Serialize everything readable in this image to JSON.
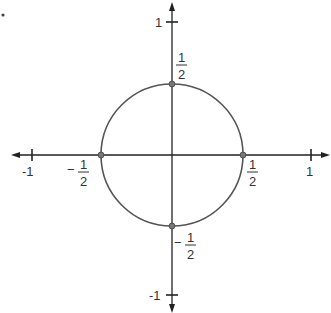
{
  "diagram": {
    "type": "unit-circle-plot",
    "circle": {
      "center": [
        0,
        0
      ],
      "radius": 0.5
    },
    "axes": {
      "x": {
        "min": -1,
        "max": 1,
        "ticks": [
          "-1",
          "1"
        ]
      },
      "y": {
        "min": -1,
        "max": 1,
        "ticks": [
          "1",
          "-1"
        ]
      }
    },
    "labels": {
      "x_neg_one": "-1",
      "x_pos_one": "1",
      "y_pos_one": "1",
      "y_neg_one": "-1",
      "x_neg_half_sign": "−",
      "x_neg_half_num": "1",
      "x_neg_half_den": "2",
      "x_pos_half_num": "1",
      "x_pos_half_den": "2",
      "y_pos_half_num": "1",
      "y_pos_half_den": "2",
      "y_neg_half_sign": "−",
      "y_neg_half_num": "1",
      "y_neg_half_den": "2"
    },
    "points": [
      {
        "name": "x-neg-half",
        "coord": [
          -0.5,
          0
        ]
      },
      {
        "name": "x-pos-half",
        "coord": [
          0.5,
          0
        ]
      },
      {
        "name": "y-pos-half",
        "coord": [
          0,
          0.5
        ]
      },
      {
        "name": "y-neg-half",
        "coord": [
          0,
          -0.5
        ]
      }
    ],
    "colors": {
      "axis": "#222222",
      "circle": "#555555",
      "point": "#666666",
      "text": "#333333"
    }
  }
}
